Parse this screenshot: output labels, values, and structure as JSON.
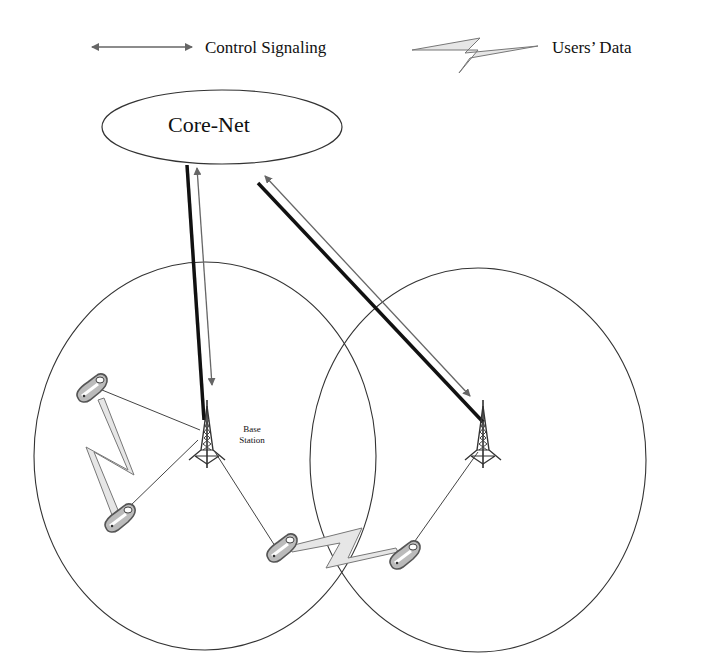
{
  "legend": {
    "control_signaling": {
      "label": "Control Signaling",
      "icon": "double-arrow-icon"
    },
    "users_data": {
      "label": "Users’  Data",
      "icon": "lightning-bolt-icon"
    }
  },
  "core_network": {
    "label": "Core-Net"
  },
  "cells": [
    {
      "name": "left-cell",
      "base_station_label": [
        "Base",
        "Station"
      ],
      "mobile_count": 4
    },
    {
      "name": "right-cell",
      "base_station_label": [],
      "mobile_count": 1
    }
  ],
  "colors": {
    "line": "#222222",
    "arrow_gray": "#666666",
    "bolt_fill": "#e6e6e6",
    "phone_fill": "#bbbbbb"
  }
}
